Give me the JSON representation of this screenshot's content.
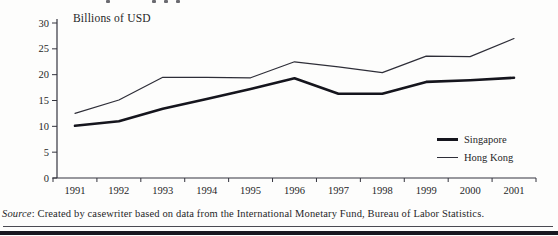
{
  "chart_data": {
    "type": "line",
    "title": "Billions of USD",
    "categories": [
      "1991",
      "1992",
      "1993",
      "1994",
      "1995",
      "1996",
      "1997",
      "1998",
      "1999",
      "2000",
      "2001"
    ],
    "series": [
      {
        "name": "Singapore",
        "values": [
          10.1,
          11.0,
          13.4,
          15.3,
          17.2,
          19.3,
          16.3,
          16.3,
          18.6,
          18.9,
          19.4
        ],
        "thickness": 2.6,
        "color": "#15151d"
      },
      {
        "name": "Hong Kong",
        "values": [
          12.5,
          15.1,
          19.5,
          19.5,
          19.4,
          22.5,
          21.5,
          20.4,
          23.6,
          23.5,
          27.0
        ],
        "thickness": 1.2,
        "color": "#2e2e38"
      }
    ],
    "ylim": [
      0,
      30
    ],
    "yticks": [
      0,
      5,
      10,
      15,
      20,
      25,
      30
    ],
    "grid": false,
    "legend_position": "inside-right"
  },
  "source_note": {
    "prefix": "Source",
    "rest": ": Created by casewriter based on data from the International Monetary Fund, Bureau of Labor Statistics."
  },
  "colors": {
    "axis": "#34343e",
    "text": "#1f1f28",
    "rule_thin": "#4a4a52",
    "rule_thick": "#181820"
  }
}
